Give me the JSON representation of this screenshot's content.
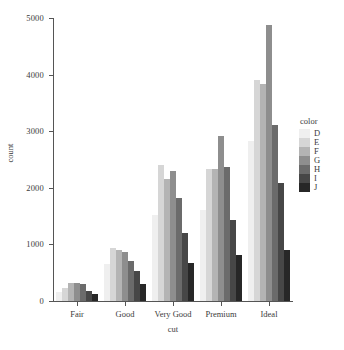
{
  "chart_data": {
    "type": "bar",
    "title": "",
    "xlabel": "cut",
    "ylabel": "count",
    "categories": [
      "Fair",
      "Good",
      "Very Good",
      "Premium",
      "Ideal"
    ],
    "legend_title": "color",
    "legend_position": "right",
    "grid": false,
    "ylim": [
      0,
      5000
    ],
    "yticks": [
      0,
      1000,
      2000,
      3000,
      4000,
      5000
    ],
    "ytick_labels": [
      "0",
      "1000",
      "2000",
      "3000",
      "4000",
      "5000"
    ],
    "series": [
      {
        "name": "D",
        "color": "#EFEFEF",
        "values": [
          163,
          662,
          1513,
          1603,
          2834
        ]
      },
      {
        "name": "E",
        "color": "#D6D6D6",
        "values": [
          224,
          933,
          2400,
          2337,
          3903
        ]
      },
      {
        "name": "F",
        "color": "#B4B4B4",
        "values": [
          312,
          909,
          2164,
          2331,
          3826
        ]
      },
      {
        "name": "G",
        "color": "#8E8E8E",
        "values": [
          314,
          871,
          2299,
          2924,
          4884
        ]
      },
      {
        "name": "H",
        "color": "#6B6B6B",
        "values": [
          303,
          702,
          1824,
          2360,
          3115
        ]
      },
      {
        "name": "I",
        "color": "#474747",
        "values": [
          175,
          522,
          1204,
          1428,
          2093
        ]
      },
      {
        "name": "J",
        "color": "#272727",
        "values": [
          119,
          307,
          678,
          808,
          896
        ]
      }
    ]
  }
}
